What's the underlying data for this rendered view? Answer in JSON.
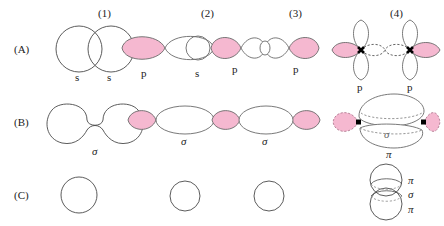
{
  "figure": {
    "type": "orbital-overlap-diagram",
    "columns": [
      {
        "id": "c1",
        "label": "(1)"
      },
      {
        "id": "c2",
        "label": "(2)"
      },
      {
        "id": "c3",
        "label": "(3)"
      },
      {
        "id": "c4",
        "label": "(4)"
      }
    ],
    "rows": [
      {
        "id": "rA",
        "label": "(A)"
      },
      {
        "id": "rB",
        "label": "(B)"
      },
      {
        "id": "rC",
        "label": "(C)"
      }
    ],
    "colors": {
      "lobe_filled": "#f5b8d0",
      "lobe_stroke": "#555555",
      "outline": "#4a4a4a",
      "dot": "#000000",
      "background": "#ffffff"
    },
    "cells": {
      "A1": {
        "description": "two overlapping s orbitals",
        "orbital_labels": [
          "s",
          "s"
        ],
        "shapes": "two equal circles overlapping side by side, unfilled"
      },
      "A2": {
        "description": "p orbital overlapping an s orbital",
        "orbital_labels": [
          "p",
          "s"
        ],
        "shapes": "filled pink p lobe on left, large unfilled lobe to the right, small s circle at right end"
      },
      "A3": {
        "description": "p orbital overlapping p orbital head-on (sigma)",
        "orbital_labels": [
          "p",
          "p"
        ],
        "shapes": "pink outer lobes, white inner lobes, small circle at centre"
      },
      "A4": {
        "description": "two p orbitals side-by-side with vertical lobes and dashed inner lobes",
        "orbital_labels": [
          "p",
          "p"
        ],
        "shapes": "each atom has up lobe, down lobe (white), outward pink lobe, dashed inward lobe; black nucleus dot"
      },
      "B1": {
        "description": "resulting sigma molecular orbital from s+s",
        "orbital_labels": [
          "σ"
        ],
        "shapes": "peanut / dumbbell outline, unfilled"
      },
      "B2": {
        "description": "resulting sigma molecular orbital from p+s",
        "orbital_labels": [
          "σ"
        ],
        "shapes": "small pink lobe left joined to large unfilled ellipse"
      },
      "B3": {
        "description": "resulting sigma molecular orbital from p+p",
        "orbital_labels": [
          "σ"
        ],
        "shapes": "pink lobe, large unfilled ellipse, pink lobe"
      },
      "B4": {
        "description": "sigma and pi molecular orbitals, end-on view",
        "orbital_labels": [
          "σ",
          "π"
        ],
        "shapes": "upper ellipse and lower ellipse with dashed back edges, pink lobes at left and right with black dots"
      },
      "C1": {
        "description": "sigma orbital cross-section",
        "orbital_labels": [],
        "shapes": "single large circle, unfilled"
      },
      "C2": {
        "description": "sigma orbital cross-section",
        "orbital_labels": [],
        "shapes": "single medium circle, unfilled"
      },
      "C3": {
        "description": "sigma orbital cross-section",
        "orbital_labels": [],
        "shapes": "single medium circle, unfilled"
      },
      "C4": {
        "description": "stacked pi / sigma / pi cross-sections",
        "orbital_labels": [
          "π",
          "σ",
          "π"
        ],
        "shapes": "two overlapping circles stacked vertically with dashed ellipses"
      }
    },
    "text": {
      "s": "s",
      "p": "p",
      "sigma": "σ",
      "pi": "π"
    }
  }
}
